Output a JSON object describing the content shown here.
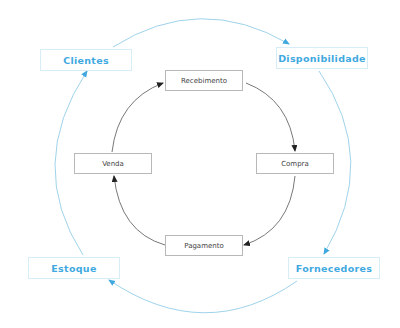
{
  "diagram": {
    "outer_cycle": [
      {
        "id": "clientes",
        "label": "Clientes"
      },
      {
        "id": "disponibilidade",
        "label": "Disponibilidade"
      },
      {
        "id": "fornecedores",
        "label": "Fornecedores"
      },
      {
        "id": "estoque",
        "label": "Estoque"
      }
    ],
    "inner_cycle": [
      {
        "id": "recebimento",
        "label": "Recebimento"
      },
      {
        "id": "compra",
        "label": "Compra"
      },
      {
        "id": "pagamento",
        "label": "Pagamento"
      },
      {
        "id": "venda",
        "label": "Venda"
      }
    ],
    "outer_edges": [
      {
        "from": "clientes",
        "to": "disponibilidade"
      },
      {
        "from": "disponibilidade",
        "to": "fornecedores"
      },
      {
        "from": "fornecedores",
        "to": "estoque"
      },
      {
        "from": "estoque",
        "to": "clientes"
      }
    ],
    "inner_edges": [
      {
        "from": "venda",
        "to": "recebimento"
      },
      {
        "from": "recebimento",
        "to": "compra"
      },
      {
        "from": "compra",
        "to": "pagamento"
      },
      {
        "from": "pagamento",
        "to": "venda"
      }
    ],
    "colors": {
      "outer_text": "#3fa9df",
      "outer_line": "#9fd3ea",
      "outer_arrow": "#3fa9df",
      "inner_line": "#555555",
      "inner_arrow": "#222222"
    }
  }
}
